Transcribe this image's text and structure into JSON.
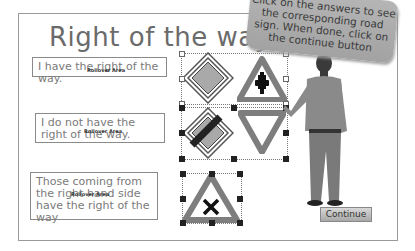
{
  "slide": {
    "title": "Right of the way",
    "instruction_bubble": "Click on the answers to see the corresponding road sign. When done, click on the continue button",
    "answers": [
      {
        "text": "I have the right of the way.",
        "tag": "Rollover Area"
      },
      {
        "text": "I do not have the right of the way.",
        "tag": "Rollover Area"
      },
      {
        "text": "Those coming from the right hand side have the right of the way",
        "tag": "Rollover Area"
      }
    ],
    "signs": [
      {
        "name": "priority-road-sign"
      },
      {
        "name": "crossroads-priority-sign"
      },
      {
        "name": "end-of-priority-road-sign"
      },
      {
        "name": "yield-sign"
      },
      {
        "name": "crossroads-right-priority-sign"
      }
    ],
    "continue_label": "Continue"
  },
  "colors": {
    "sign_gray": "#7e7e7e",
    "diamond_fill": "#a9a9a9",
    "bubble": "#aaaaaa"
  }
}
